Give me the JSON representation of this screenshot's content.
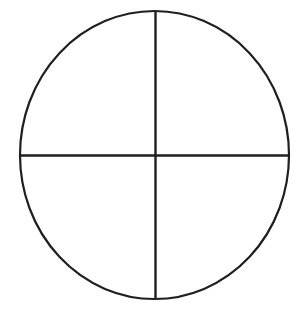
{
  "canvas": {
    "width": 301,
    "height": 312,
    "background_color": "#ffffff",
    "title": "Circle divided into four quadrants"
  },
  "style": {
    "stroke_color": "#1f1f1f",
    "outline_stroke_width": 2.2,
    "axis_stroke_width": 2.4,
    "fill_color": "none"
  },
  "figure": {
    "shape_name": "circle",
    "center_x": 154.5,
    "center_y": 155,
    "radius_x": 134.5,
    "radius_y": 144,
    "bounds": {
      "left": 20,
      "right": 289,
      "top": 11,
      "bottom": 299
    }
  },
  "divisions": {
    "count": 4,
    "vertical_line": {
      "name": "vertical-diameter",
      "x": 155.5,
      "y1": 11,
      "y2": 299
    },
    "horizontal_line": {
      "name": "horizontal-diameter",
      "y": 155.5,
      "x1": 20,
      "x2": 289
    },
    "quadrants": [
      {
        "name": "upper-left-quadrant"
      },
      {
        "name": "upper-right-quadrant"
      },
      {
        "name": "lower-left-quadrant"
      },
      {
        "name": "lower-right-quadrant"
      }
    ]
  }
}
